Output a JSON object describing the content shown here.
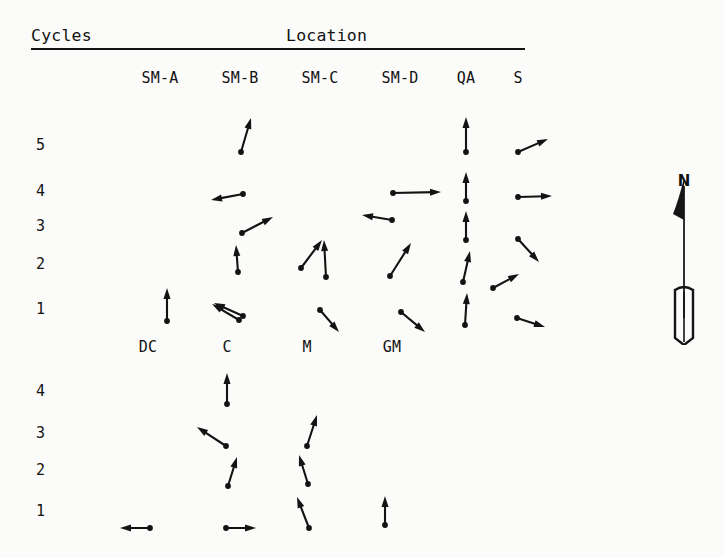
{
  "figure": {
    "title_left": "Cycles",
    "title_right": "Location",
    "compass_label": "N",
    "compass_name": "north-arrow",
    "ink_color": "#131313",
    "paper_color": "#fbfbf9"
  },
  "columns_top": [
    {
      "label": "SM-A",
      "x": 160
    },
    {
      "label": "SM-B",
      "x": 240
    },
    {
      "label": "SM-C",
      "x": 320
    },
    {
      "label": "SM-D",
      "x": 400
    },
    {
      "label": "QA",
      "x": 466
    },
    {
      "label": "S",
      "x": 518
    }
  ],
  "columns_bottom": [
    {
      "label": "DC",
      "x": 148
    },
    {
      "label": "C",
      "x": 227
    },
    {
      "label": "M",
      "x": 307
    },
    {
      "label": "GM",
      "x": 392
    }
  ],
  "rows_top": [
    {
      "label": "5",
      "y": 145
    },
    {
      "label": "4",
      "y": 191
    },
    {
      "label": "3",
      "y": 226
    },
    {
      "label": "2",
      "y": 264
    },
    {
      "label": "1",
      "y": 309
    }
  ],
  "rows_bottom": [
    {
      "label": "4",
      "y": 391
    },
    {
      "label": "3",
      "y": 433
    },
    {
      "label": "2",
      "y": 470
    },
    {
      "label": "1",
      "y": 511
    }
  ],
  "chart_data": {
    "type": "scatter",
    "subtype": "vector-field",
    "xlabel": "Location",
    "ylabel": "Cycles",
    "grid": false,
    "legend": null,
    "annotations": [
      "N"
    ],
    "x_categories_block1": [
      "SM-A",
      "SM-B",
      "SM-C",
      "SM-D",
      "QA",
      "S"
    ],
    "x_categories_block2": [
      "DC",
      "C",
      "M",
      "GM"
    ],
    "y_categories_block1": [
      "5",
      "4",
      "3",
      "2",
      "1"
    ],
    "y_categories_block2": [
      "4",
      "3",
      "2",
      "1"
    ],
    "vectors": [
      {
        "block": 1,
        "location": "SM-B",
        "cycle": "5",
        "tail": [
          241,
          152
        ],
        "tip": [
          251,
          118
        ],
        "bearing_deg": 16
      },
      {
        "block": 1,
        "location": "SM-B",
        "cycle": "4",
        "tail": [
          243,
          194
        ],
        "tip": [
          211,
          200
        ],
        "bearing_deg": 280
      },
      {
        "block": 1,
        "location": "SM-B",
        "cycle": "3",
        "tail": [
          242,
          233
        ],
        "tip": [
          273,
          217
        ],
        "bearing_deg": 63
      },
      {
        "block": 1,
        "location": "SM-B",
        "cycle": "2",
        "tail": [
          238,
          272
        ],
        "tip": [
          236,
          245
        ],
        "bearing_deg": 4
      },
      {
        "block": 1,
        "location": "SM-B",
        "cycle": "1",
        "tail": [
          239,
          320
        ],
        "tip": [
          212,
          304
        ],
        "bearing_deg": 301
      },
      {
        "block": 1,
        "location": "SM-C",
        "cycle": "3",
        "tail": [
          392,
          220
        ],
        "tip": [
          362,
          215
        ],
        "bearing_deg": 280
      },
      {
        "block": 1,
        "location": "SM-C",
        "cycle": "2a",
        "tail": [
          301,
          268
        ],
        "tip": [
          322,
          240
        ],
        "bearing_deg": 37
      },
      {
        "block": 1,
        "location": "SM-C",
        "cycle": "2b",
        "tail": [
          326,
          277
        ],
        "tip": [
          324,
          240
        ],
        "bearing_deg": 3
      },
      {
        "block": 1,
        "location": "SM-C",
        "cycle": "1",
        "tail": [
          320,
          310
        ],
        "tip": [
          339,
          332
        ],
        "bearing_deg": 139
      },
      {
        "block": 1,
        "location": "SM-D",
        "cycle": "4",
        "tail": [
          393,
          193
        ],
        "tip": [
          441,
          192
        ],
        "bearing_deg": 91
      },
      {
        "block": 1,
        "location": "SM-D",
        "cycle": "2",
        "tail": [
          390,
          276
        ],
        "tip": [
          411,
          243
        ],
        "bearing_deg": 32
      },
      {
        "block": 1,
        "location": "SM-D",
        "cycle": "1",
        "tail": [
          401,
          312
        ],
        "tip": [
          425,
          332
        ],
        "bearing_deg": 130
      },
      {
        "block": 1,
        "location": "QA",
        "cycle": "5",
        "tail": [
          466,
          152
        ],
        "tip": [
          466,
          117
        ],
        "bearing_deg": 0
      },
      {
        "block": 1,
        "location": "QA",
        "cycle": "4",
        "tail": [
          466,
          201
        ],
        "tip": [
          466,
          172
        ],
        "bearing_deg": 0
      },
      {
        "block": 1,
        "location": "QA",
        "cycle": "3",
        "tail": [
          466,
          240
        ],
        "tip": [
          466,
          211
        ],
        "bearing_deg": 0
      },
      {
        "block": 1,
        "location": "QA",
        "cycle": "2",
        "tail": [
          463,
          282
        ],
        "tip": [
          470,
          251
        ],
        "bearing_deg": 13
      },
      {
        "block": 1,
        "location": "QA",
        "cycle": "1",
        "tail": [
          465,
          325
        ],
        "tip": [
          467,
          293
        ],
        "bearing_deg": 4
      },
      {
        "block": 1,
        "location": "S",
        "cycle": "5",
        "tail": [
          518,
          152
        ],
        "tip": [
          548,
          139
        ],
        "bearing_deg": 66
      },
      {
        "block": 1,
        "location": "S",
        "cycle": "4",
        "tail": [
          518,
          197
        ],
        "tip": [
          552,
          196
        ],
        "bearing_deg": 91
      },
      {
        "block": 1,
        "location": "S",
        "cycle": "3",
        "tail": [
          518,
          239
        ],
        "tip": [
          539,
          262
        ],
        "bearing_deg": 137
      },
      {
        "block": 1,
        "location": "S",
        "cycle": "2",
        "tail": [
          493,
          288
        ],
        "tip": [
          519,
          274
        ],
        "bearing_deg": 62
      },
      {
        "block": 1,
        "location": "S",
        "cycle": "1",
        "tail": [
          517,
          318
        ],
        "tip": [
          545,
          327
        ],
        "bearing_deg": 108
      },
      {
        "block": 1,
        "location": "DC",
        "cycle": "1",
        "tail": [
          167,
          321
        ],
        "tip": [
          167,
          288
        ],
        "bearing_deg": 0
      },
      {
        "block": 1,
        "location": "C",
        "cycle": "1",
        "tail": [
          243,
          316
        ],
        "tip": [
          214,
          303
        ],
        "bearing_deg": 294
      },
      {
        "block": 1,
        "location": "M",
        "cycle": "1",
        "tail": [
          320,
          310
        ],
        "tip": [
          339,
          332
        ],
        "bearing_deg": 139
      },
      {
        "block": 1,
        "location": "GM",
        "cycle": "1",
        "tail": [
          401,
          312
        ],
        "tip": [
          425,
          332
        ],
        "bearing_deg": 130
      },
      {
        "block": 2,
        "location": "C",
        "cycle": "4",
        "tail": [
          227,
          404
        ],
        "tip": [
          227,
          373
        ],
        "bearing_deg": 0
      },
      {
        "block": 2,
        "location": "C",
        "cycle": "3",
        "tail": [
          226,
          446
        ],
        "tip": [
          197,
          427
        ],
        "bearing_deg": 303
      },
      {
        "block": 2,
        "location": "C",
        "cycle": "2",
        "tail": [
          228,
          486
        ],
        "tip": [
          237,
          457
        ],
        "bearing_deg": 17
      },
      {
        "block": 2,
        "location": "C",
        "cycle": "1",
        "tail": [
          226,
          528
        ],
        "tip": [
          256,
          528
        ],
        "bearing_deg": 90
      },
      {
        "block": 2,
        "location": "M",
        "cycle": "3",
        "tail": [
          307,
          446
        ],
        "tip": [
          317,
          415
        ],
        "bearing_deg": 18
      },
      {
        "block": 2,
        "location": "M",
        "cycle": "2",
        "tail": [
          308,
          484
        ],
        "tip": [
          299,
          455
        ],
        "bearing_deg": 343
      },
      {
        "block": 2,
        "location": "M",
        "cycle": "1",
        "tail": [
          309,
          528
        ],
        "tip": [
          297,
          497
        ],
        "bearing_deg": 339
      },
      {
        "block": 2,
        "location": "GM",
        "cycle": "1",
        "tail": [
          385,
          525
        ],
        "tip": [
          385,
          496
        ],
        "bearing_deg": 0
      },
      {
        "block": 2,
        "location": "DC",
        "cycle": "1",
        "tail": [
          150,
          528
        ],
        "tip": [
          120,
          528
        ],
        "bearing_deg": 270
      }
    ]
  }
}
